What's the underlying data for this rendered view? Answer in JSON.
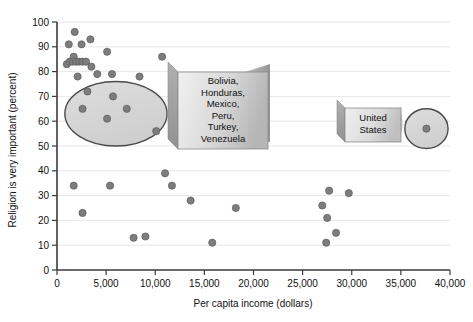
{
  "chart_data": {
    "type": "scatter",
    "title": "",
    "xlabel": "Per capita income (dollars)",
    "ylabel": "Religion is very important (percent)",
    "xlim": [
      0,
      40000
    ],
    "ylim": [
      0,
      100
    ],
    "xticks": [
      0,
      5000,
      10000,
      15000,
      20000,
      25000,
      30000,
      35000,
      40000
    ],
    "xtick_labels": [
      "0",
      "5,000",
      "10,000",
      "15,000",
      "20,000",
      "25,000",
      "30,000",
      "35,000",
      "40,000"
    ],
    "yticks": [
      0,
      10,
      20,
      30,
      40,
      50,
      60,
      70,
      80,
      90,
      100
    ],
    "ytick_labels": [
      "0",
      "10",
      "20",
      "30",
      "40",
      "50",
      "60",
      "70",
      "80",
      "90",
      "100"
    ],
    "grid": "horizontal",
    "legend": "none",
    "marker_color": "#7d7d7d",
    "marker_edge_color": "#5a5a5a",
    "marker_size": 6,
    "points": [
      {
        "x": 1800,
        "y": 96
      },
      {
        "x": 1200,
        "y": 91
      },
      {
        "x": 2500,
        "y": 91
      },
      {
        "x": 3400,
        "y": 93
      },
      {
        "x": 1700,
        "y": 86
      },
      {
        "x": 1000,
        "y": 83
      },
      {
        "x": 1300,
        "y": 84
      },
      {
        "x": 1600,
        "y": 84
      },
      {
        "x": 1950,
        "y": 84
      },
      {
        "x": 2250,
        "y": 84
      },
      {
        "x": 2600,
        "y": 84
      },
      {
        "x": 2950,
        "y": 84
      },
      {
        "x": 3500,
        "y": 82
      },
      {
        "x": 5100,
        "y": 88
      },
      {
        "x": 4100,
        "y": 79
      },
      {
        "x": 5600,
        "y": 79
      },
      {
        "x": 2100,
        "y": 78
      },
      {
        "x": 10700,
        "y": 86
      },
      {
        "x": 8400,
        "y": 78
      },
      {
        "x": 3100,
        "y": 72
      },
      {
        "x": 5700,
        "y": 70
      },
      {
        "x": 2600,
        "y": 65
      },
      {
        "x": 7100,
        "y": 65
      },
      {
        "x": 5100,
        "y": 61
      },
      {
        "x": 10100,
        "y": 56
      },
      {
        "x": 1700,
        "y": 34
      },
      {
        "x": 5400,
        "y": 34
      },
      {
        "x": 2600,
        "y": 23
      },
      {
        "x": 11000,
        "y": 39
      },
      {
        "x": 11700,
        "y": 34
      },
      {
        "x": 13600,
        "y": 28
      },
      {
        "x": 18200,
        "y": 25
      },
      {
        "x": 7800,
        "y": 13
      },
      {
        "x": 9000,
        "y": 13.5
      },
      {
        "x": 15800,
        "y": 11
      },
      {
        "x": 27700,
        "y": 32
      },
      {
        "x": 29700,
        "y": 31
      },
      {
        "x": 27000,
        "y": 26
      },
      {
        "x": 27500,
        "y": 21
      },
      {
        "x": 28400,
        "y": 15
      },
      {
        "x": 27400,
        "y": 11
      },
      {
        "x": 37600,
        "y": 57
      }
    ],
    "annotations": [
      {
        "name": "cluster-ellipse-left",
        "shape": "ellipse",
        "cx": 6000,
        "cy": 63,
        "rx": 5200,
        "ry": 13
      },
      {
        "name": "cluster-ellipse-right",
        "shape": "ellipse",
        "cx": 37600,
        "cy": 57,
        "rx": 2200,
        "ry": 8
      }
    ]
  },
  "callouts": {
    "left": {
      "name": "countries-callout",
      "lines": [
        "Bolivia,",
        "Honduras,",
        "Mexico,",
        "Peru,",
        "Turkey,",
        "Venezuela"
      ]
    },
    "right": {
      "name": "united-states-callout",
      "lines": [
        "United",
        "States"
      ]
    }
  },
  "colors": {
    "axis": "#3a3a3a",
    "grid": "#e8e8e8",
    "marker_fill": "#7d7d7d",
    "marker_stroke": "#5c5c5c",
    "ellipse_stroke": "#4a4a4a",
    "ellipse_fill": "#d6d6d6",
    "callout_fill_light": "#e3e3e3",
    "callout_fill_dark": "#b9b9b9",
    "callout_border": "#8a8a8a",
    "text": "#111111"
  }
}
